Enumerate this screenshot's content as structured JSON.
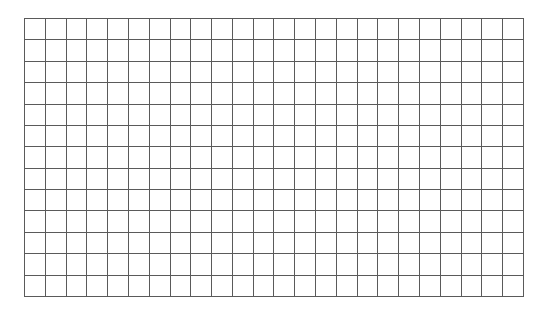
{
  "grid": {
    "rows": 13,
    "columns": 24,
    "line_color": "#5a5a5a",
    "background_color": "#ffffff"
  }
}
